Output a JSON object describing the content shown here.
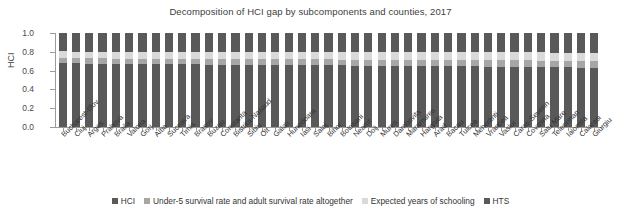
{
  "chart": {
    "title": "Decomposition of HCI gap by subcomponents and counties, 2017",
    "ylabel": "HCI"
  },
  "legend": {
    "position": "bottom",
    "items": [
      {
        "label": "HCI",
        "color": "#595959"
      },
      {
        "label": "Under-5 survival rate and adult survival rate altogether",
        "color": "#a6a6a6"
      },
      {
        "label": "Expected years of schooling",
        "color": "#d9d9d9"
      },
      {
        "label": "HTS",
        "color": "#595959"
      }
    ]
  },
  "chart_data": {
    "type": "bar",
    "title": "Decomposition of HCI gap by subcomponents and counties, 2017",
    "xlabel": "",
    "ylabel": "HCI",
    "ylim": [
      0.0,
      1.0
    ],
    "yticks": [
      "0.0",
      "0.2",
      "0.4",
      "0.6",
      "0.8",
      "1.0"
    ],
    "ytick_values": [
      0.0,
      0.2,
      0.4,
      0.6,
      0.8,
      1.0
    ],
    "grid": false,
    "stacked": true,
    "stack_total": 1.0,
    "categories": [
      "Bucharest-Ilfov",
      "Cluj",
      "Arges",
      "Prahova",
      "Braila",
      "Valcea",
      "Gorj",
      "Alba",
      "Suceava",
      "Timis",
      "Brasov",
      "Buzau",
      "Constanta",
      "Bistrita-Nasaud",
      "Sibiu",
      "Olt",
      "Galati",
      "Hunedoara",
      "Iasi",
      "Salaj",
      "Bihor",
      "Botosani",
      "Neamt",
      "Dolj",
      "Mures",
      "Dambovita",
      "Maramures",
      "Harghita",
      "Arad",
      "Bacau",
      "Tulcea",
      "Mehedinti",
      "Vrancea",
      "Vaslui",
      "Caras-Severin",
      "Covasna",
      "Satu Mare",
      "Teleorman",
      "Ialomita",
      "Calarasi",
      "Giurgiu"
    ],
    "series": [
      {
        "name": "HCI",
        "color": "#595959",
        "values": [
          0.68,
          0.677,
          0.675,
          0.674,
          0.672,
          0.671,
          0.67,
          0.669,
          0.668,
          0.667,
          0.666,
          0.665,
          0.664,
          0.663,
          0.662,
          0.661,
          0.66,
          0.659,
          0.658,
          0.657,
          0.656,
          0.655,
          0.654,
          0.653,
          0.652,
          0.651,
          0.65,
          0.649,
          0.648,
          0.647,
          0.646,
          0.645,
          0.643,
          0.642,
          0.641,
          0.64,
          0.638,
          0.636,
          0.634,
          0.632,
          0.63
        ]
      },
      {
        "name": "Under-5 survival rate and adult survival rate altogether",
        "color": "#a6a6a6",
        "values": [
          0.055,
          0.056,
          0.056,
          0.057,
          0.057,
          0.058,
          0.058,
          0.058,
          0.059,
          0.059,
          0.059,
          0.06,
          0.06,
          0.06,
          0.061,
          0.061,
          0.061,
          0.062,
          0.062,
          0.062,
          0.063,
          0.063,
          0.063,
          0.064,
          0.064,
          0.064,
          0.065,
          0.065,
          0.065,
          0.066,
          0.066,
          0.066,
          0.067,
          0.067,
          0.068,
          0.068,
          0.069,
          0.069,
          0.07,
          0.07,
          0.071
        ]
      },
      {
        "name": "Expected years of schooling",
        "color": "#d9d9d9",
        "values": [
          0.07,
          0.07,
          0.071,
          0.071,
          0.072,
          0.072,
          0.073,
          0.073,
          0.073,
          0.074,
          0.074,
          0.075,
          0.075,
          0.075,
          0.076,
          0.076,
          0.077,
          0.077,
          0.077,
          0.078,
          0.078,
          0.079,
          0.079,
          0.08,
          0.08,
          0.08,
          0.081,
          0.081,
          0.082,
          0.082,
          0.083,
          0.083,
          0.084,
          0.084,
          0.085,
          0.085,
          0.086,
          0.087,
          0.088,
          0.089,
          0.09
        ]
      },
      {
        "name": "HTS",
        "color": "#595959",
        "values": [
          0.195,
          0.197,
          0.198,
          0.198,
          0.199,
          0.199,
          0.199,
          0.2,
          0.2,
          0.2,
          0.201,
          0.2,
          0.201,
          0.202,
          0.201,
          0.202,
          0.202,
          0.202,
          0.203,
          0.203,
          0.203,
          0.203,
          0.204,
          0.203,
          0.204,
          0.205,
          0.204,
          0.205,
          0.205,
          0.205,
          0.205,
          0.206,
          0.206,
          0.207,
          0.206,
          0.207,
          0.207,
          0.208,
          0.208,
          0.209,
          0.209
        ]
      }
    ]
  }
}
